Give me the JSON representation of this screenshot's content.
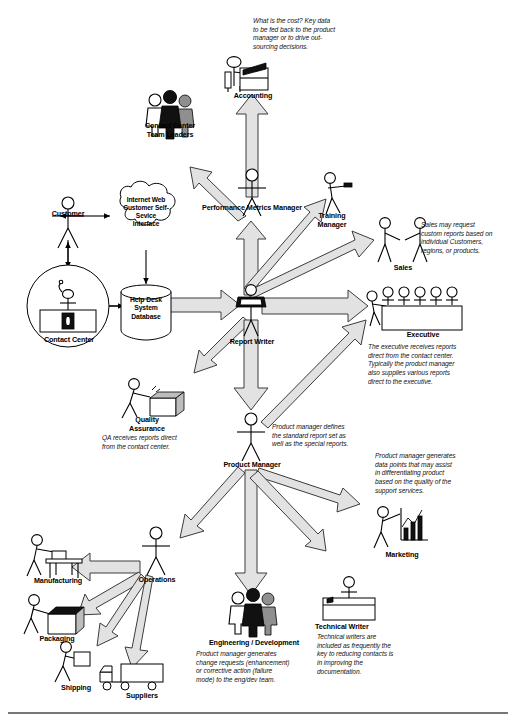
{
  "diagram": {
    "nodes": [
      {
        "id": "accounting",
        "label": "Accounting",
        "icon": "person-at-desk-icon"
      },
      {
        "id": "contact_center_team_leaders",
        "label": "Contact Center\nTeam Leaders",
        "icon": "three-people-icon"
      },
      {
        "id": "customer",
        "label": "Customer",
        "icon": "stick-person-icon"
      },
      {
        "id": "web_self_service",
        "label": "Internet Web\nCustomer Self-\nSevice\nInterface",
        "icon": "cloud-icon"
      },
      {
        "id": "contact_center",
        "label": "Contact Center",
        "icon": "agent-desk-circle-icon"
      },
      {
        "id": "helpdesk_db",
        "label": "Help Desk\nSystem\nDatabase",
        "icon": "database-cylinder-icon"
      },
      {
        "id": "performance_metrics_manager",
        "label": "Performance Metrics Manager",
        "icon": "stick-person-icon"
      },
      {
        "id": "training_manager",
        "label": "Training\nManager",
        "icon": "person-pointer-icon"
      },
      {
        "id": "sales",
        "label": "Sales",
        "icon": "two-people-handshake-icon"
      },
      {
        "id": "report_writer",
        "label": "Report  Writer",
        "icon": "person-with-laptop-icon"
      },
      {
        "id": "executive",
        "label": "Executive",
        "icon": "boardroom-table-icon"
      },
      {
        "id": "quality_assurance",
        "label": "Quality\nAssurance",
        "icon": "person-inspecting-box-icon"
      },
      {
        "id": "product_manager",
        "label": "Product  Manager",
        "icon": "stick-person-icon"
      },
      {
        "id": "marketing",
        "label": "Marketing",
        "icon": "person-with-bar-chart-icon"
      },
      {
        "id": "operations",
        "label": "Operations",
        "icon": "stick-person-icon"
      },
      {
        "id": "manufacturing",
        "label": "Manufacturing",
        "icon": "person-at-workbench-icon"
      },
      {
        "id": "packaging",
        "label": "Packaging",
        "icon": "person-packing-box-icon"
      },
      {
        "id": "shipping",
        "label": "Shipping",
        "icon": "person-carrying-box-icon"
      },
      {
        "id": "suppliers",
        "label": "Suppliers",
        "icon": "delivery-truck-icon"
      },
      {
        "id": "engineering",
        "label": "Engineering / Development",
        "icon": "three-people-icon"
      },
      {
        "id": "technical_writer",
        "label": "Technical Writer",
        "icon": "person-at-desk-icon"
      }
    ],
    "notes": [
      {
        "id": "note_accounting",
        "text": "What is the cost?  Key data\nto be fed back to the product\nmanager or to drive out-\nsourcing decisions."
      },
      {
        "id": "note_sales",
        "text": "Sales may request\ncustom reports based on\nindividual Customers,\nregions, or products."
      },
      {
        "id": "note_executive",
        "text": "The executive receives reports\ndirect from the contact center.\nTypically the product manager\nalso supplies various reports\ndirect to the executive."
      },
      {
        "id": "note_qa",
        "text": "QA receives reports direct\nfrom the contact center."
      },
      {
        "id": "note_product_manager",
        "text": "Product manager defines\nthe standard report set as\nwell as the special reports."
      },
      {
        "id": "note_marketing",
        "text": "Product manager generates\ndata points that may assist\nin differentiating product\nbased on the quality of the\nsupport services."
      },
      {
        "id": "note_engineering",
        "text": "Product manager generates\nchange requests (enhancement)\nor corrective action (failure\nmode) to the eng/dev team."
      },
      {
        "id": "note_technical_writer",
        "text": "Technical writers are\nincluded as frequently the\nkey to reducing contacts is\nin improving the\ndocumentation."
      }
    ],
    "colors": {
      "arrow_fill": "#e2e2e2",
      "arrow_stroke": "#3c3c3c",
      "line": "#000000",
      "text": "#000000",
      "divider": "#4a4a4a",
      "figure_dark": "#0d0d0d",
      "figure_mid": "#8a8a8a",
      "figure_light": "#ffffff"
    }
  }
}
